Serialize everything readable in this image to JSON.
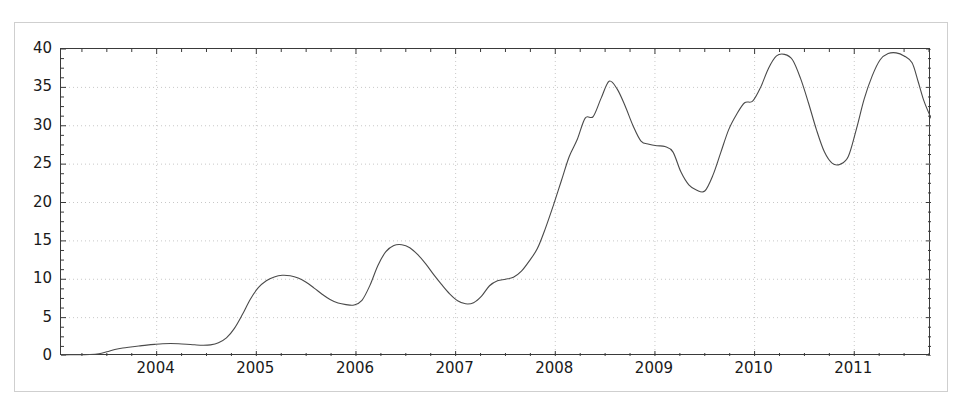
{
  "figure": {
    "background_color": "#ffffff",
    "frame_color": "#cfcfcf",
    "axis_color": "#3a3a3a",
    "grid_color": "#c8c8c8",
    "line_color": "#4a4a4a"
  },
  "chart_data": {
    "type": "line",
    "title": "",
    "subtitle": "",
    "xlabel": "",
    "ylabel": "",
    "xlim": [
      2003.04,
      2011.77
    ],
    "ylim": [
      0,
      40
    ],
    "grid": true,
    "grid_style": "dotted",
    "legend": null,
    "legend_position": "none",
    "x_tick_labels": [
      "2004",
      "2005",
      "2006",
      "2007",
      "2008",
      "2009",
      "2010",
      "2011"
    ],
    "x_ticks": [
      2004,
      2005,
      2006,
      2007,
      2008,
      2009,
      2010,
      2011
    ],
    "y_tick_labels": [
      "0",
      "5",
      "10",
      "15",
      "20",
      "25",
      "30",
      "35",
      "40"
    ],
    "y_ticks": [
      0,
      5,
      10,
      15,
      20,
      25,
      30,
      35,
      40
    ],
    "series": [
      {
        "name": "series-1",
        "color": "#4a4a4a",
        "line_width": 1.1,
        "x": [
          2003.04,
          2003.12,
          2003.2,
          2003.28,
          2003.36,
          2003.44,
          2003.5,
          2003.58,
          2003.66,
          2003.74,
          2003.82,
          2003.9,
          2003.98,
          2004.06,
          2004.14,
          2004.22,
          2004.3,
          2004.38,
          2004.46,
          2004.54,
          2004.62,
          2004.7,
          2004.78,
          2004.86,
          2004.94,
          2005.02,
          2005.1,
          2005.18,
          2005.26,
          2005.34,
          2005.42,
          2005.5,
          2005.58,
          2005.66,
          2005.74,
          2005.82,
          2005.9,
          2005.98,
          2006.06,
          2006.14,
          2006.22,
          2006.3,
          2006.38,
          2006.46,
          2006.54,
          2006.62,
          2006.7,
          2006.78,
          2006.86,
          2006.94,
          2007.02,
          2007.1,
          2007.18,
          2007.26,
          2007.34,
          2007.42,
          2007.5,
          2007.58,
          2007.66,
          2007.74,
          2007.82,
          2007.9,
          2007.98,
          2008.06,
          2008.14,
          2008.22,
          2008.3,
          2008.38,
          2008.46,
          2008.54,
          2008.62,
          2008.7,
          2008.78,
          2008.86,
          2008.94,
          2009.02,
          2009.1,
          2009.18,
          2009.26,
          2009.34,
          2009.42,
          2009.5,
          2009.58,
          2009.66,
          2009.74,
          2009.82,
          2009.9,
          2009.98,
          2010.06,
          2010.14,
          2010.22,
          2010.3,
          2010.38,
          2010.46,
          2010.54,
          2010.62,
          2010.7,
          2010.78,
          2010.86,
          2010.94,
          2011.02,
          2011.1,
          2011.18,
          2011.26,
          2011.34,
          2011.42,
          2011.5,
          2011.58,
          2011.64,
          2011.7,
          2011.77
        ],
        "y": [
          0.15,
          0.15,
          0.16,
          0.18,
          0.2,
          0.25,
          0.45,
          0.75,
          1.0,
          1.15,
          1.3,
          1.4,
          1.5,
          1.6,
          1.62,
          1.6,
          1.55,
          1.45,
          1.4,
          1.45,
          1.7,
          2.3,
          3.6,
          5.5,
          7.4,
          8.9,
          9.8,
          10.3,
          10.5,
          10.45,
          10.2,
          9.6,
          8.9,
          8.1,
          7.4,
          6.9,
          6.7,
          6.6,
          7.2,
          9.2,
          11.8,
          13.6,
          14.4,
          14.5,
          14.1,
          13.2,
          12.0,
          10.6,
          9.3,
          8.1,
          7.2,
          6.8,
          6.9,
          7.7,
          9.1,
          9.8,
          10.0,
          10.2,
          11.0,
          12.4,
          14.0,
          16.6,
          19.6,
          22.8,
          26.0,
          28.2,
          31.0,
          31.2,
          33.6,
          35.8,
          34.8,
          32.6,
          30.0,
          28.0,
          27.6,
          27.4,
          27.3,
          26.6,
          24.0,
          22.3,
          21.6,
          21.5,
          23.5,
          26.5,
          29.5,
          31.5,
          33.0,
          33.2,
          35.0,
          37.5,
          39.1,
          39.3,
          38.6,
          36.2,
          33.0,
          29.5,
          26.6,
          25.1,
          25.0,
          26.0,
          29.5,
          33.5,
          36.5,
          38.6,
          39.4,
          39.5,
          39.1,
          38.2,
          35.8,
          33.2,
          31.0
        ]
      }
    ],
    "annotations": []
  },
  "curve_points": {
    "description": "dense sampled polyline of the plotted curve in data coordinates (year, value)",
    "points": [
      [
        2003.04,
        0.15
      ],
      [
        2003.2,
        0.16
      ],
      [
        2003.33,
        0.2
      ],
      [
        2003.42,
        0.3
      ],
      [
        2003.5,
        0.55
      ],
      [
        2003.58,
        0.85
      ],
      [
        2003.66,
        1.05
      ],
      [
        2003.74,
        1.18
      ],
      [
        2003.82,
        1.3
      ],
      [
        2003.9,
        1.42
      ],
      [
        2003.98,
        1.52
      ],
      [
        2004.06,
        1.6
      ],
      [
        2004.14,
        1.62
      ],
      [
        2004.22,
        1.6
      ],
      [
        2004.3,
        1.54
      ],
      [
        2004.38,
        1.46
      ],
      [
        2004.46,
        1.4
      ],
      [
        2004.54,
        1.45
      ],
      [
        2004.62,
        1.72
      ],
      [
        2004.7,
        2.35
      ],
      [
        2004.78,
        3.6
      ],
      [
        2004.86,
        5.4
      ],
      [
        2004.94,
        7.4
      ],
      [
        2005.02,
        8.9
      ],
      [
        2005.1,
        9.8
      ],
      [
        2005.18,
        10.3
      ],
      [
        2005.26,
        10.52
      ],
      [
        2005.34,
        10.45
      ],
      [
        2005.42,
        10.15
      ],
      [
        2005.5,
        9.6
      ],
      [
        2005.58,
        8.85
      ],
      [
        2005.66,
        8.05
      ],
      [
        2005.74,
        7.35
      ],
      [
        2005.82,
        6.9
      ],
      [
        2005.9,
        6.7
      ],
      [
        2005.98,
        6.65
      ],
      [
        2006.06,
        7.25
      ],
      [
        2006.14,
        9.2
      ],
      [
        2006.22,
        11.8
      ],
      [
        2006.3,
        13.6
      ],
      [
        2006.38,
        14.4
      ],
      [
        2006.46,
        14.5
      ],
      [
        2006.54,
        14.1
      ],
      [
        2006.62,
        13.2
      ],
      [
        2006.7,
        12.0
      ],
      [
        2006.78,
        10.6
      ],
      [
        2006.86,
        9.3
      ],
      [
        2006.94,
        8.1
      ],
      [
        2007.02,
        7.2
      ],
      [
        2007.1,
        6.8
      ],
      [
        2007.18,
        6.95
      ],
      [
        2007.26,
        7.8
      ],
      [
        2007.34,
        9.15
      ],
      [
        2007.42,
        9.8
      ],
      [
        2007.5,
        10.0
      ],
      [
        2007.58,
        10.25
      ],
      [
        2007.66,
        11.05
      ],
      [
        2007.74,
        12.4
      ],
      [
        2007.82,
        14.0
      ],
      [
        2007.9,
        16.6
      ],
      [
        2007.98,
        19.6
      ],
      [
        2008.06,
        22.8
      ],
      [
        2008.14,
        26.0
      ],
      [
        2008.22,
        28.2
      ],
      [
        2008.3,
        31.0
      ],
      [
        2008.38,
        31.2
      ],
      [
        2008.46,
        33.6
      ],
      [
        2008.54,
        35.8
      ],
      [
        2008.62,
        34.8
      ],
      [
        2008.7,
        32.6
      ],
      [
        2008.78,
        30.0
      ],
      [
        2008.86,
        28.0
      ],
      [
        2008.94,
        27.6
      ],
      [
        2009.02,
        27.4
      ],
      [
        2009.1,
        27.3
      ],
      [
        2009.18,
        26.6
      ],
      [
        2009.26,
        24.0
      ],
      [
        2009.34,
        22.3
      ],
      [
        2009.42,
        21.6
      ],
      [
        2009.5,
        21.5
      ],
      [
        2009.58,
        23.5
      ],
      [
        2009.66,
        26.5
      ],
      [
        2009.74,
        29.5
      ],
      [
        2009.82,
        31.5
      ],
      [
        2009.9,
        33.0
      ],
      [
        2009.98,
        33.2
      ],
      [
        2010.06,
        35.0
      ],
      [
        2010.14,
        37.5
      ],
      [
        2010.22,
        39.1
      ],
      [
        2010.3,
        39.3
      ],
      [
        2010.38,
        38.6
      ],
      [
        2010.46,
        36.2
      ],
      [
        2010.54,
        33.0
      ],
      [
        2010.62,
        29.5
      ],
      [
        2010.7,
        26.6
      ],
      [
        2010.78,
        25.1
      ],
      [
        2010.86,
        25.0
      ],
      [
        2010.94,
        26.0
      ],
      [
        2011.02,
        29.5
      ],
      [
        2011.1,
        33.5
      ],
      [
        2011.18,
        36.5
      ],
      [
        2011.26,
        38.6
      ],
      [
        2011.34,
        39.4
      ],
      [
        2011.42,
        39.5
      ],
      [
        2011.5,
        39.1
      ],
      [
        2011.58,
        38.2
      ],
      [
        2011.64,
        35.8
      ],
      [
        2011.7,
        33.2
      ],
      [
        2011.77,
        31.0
      ]
    ]
  }
}
